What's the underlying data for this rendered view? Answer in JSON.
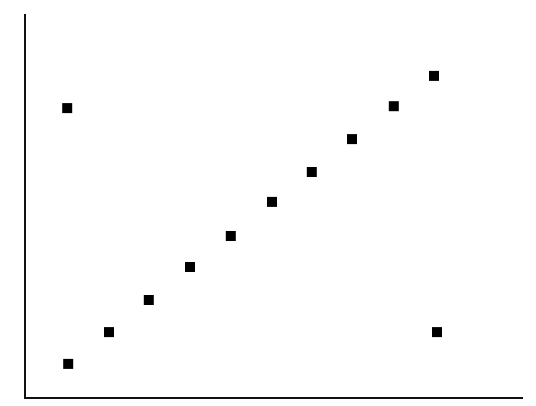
{
  "chart_data": {
    "type": "scatter",
    "title": "",
    "xlabel": "",
    "ylabel": "",
    "xlim": [
      0,
      100
    ],
    "ylim": [
      0,
      100
    ],
    "grid": false,
    "legend": null,
    "ticks": false,
    "marker": "square",
    "marker_color": "#000000",
    "axis_color": "#111111",
    "note": "No tick labels visible; values are estimated on a normalized 0-100 scale relative to the axis box.",
    "series": [
      {
        "name": "points",
        "points": [
          {
            "x": 8.5,
            "y": 75.7
          },
          {
            "x": 8.7,
            "y": 8.9
          },
          {
            "x": 16.9,
            "y": 17.2
          },
          {
            "x": 24.9,
            "y": 25.6
          },
          {
            "x": 33.2,
            "y": 34.2
          },
          {
            "x": 41.4,
            "y": 42.3
          },
          {
            "x": 49.7,
            "y": 51.2
          },
          {
            "x": 57.7,
            "y": 59.0
          },
          {
            "x": 65.8,
            "y": 67.6
          },
          {
            "x": 74.2,
            "y": 76.2
          },
          {
            "x": 82.3,
            "y": 84.1
          },
          {
            "x": 82.9,
            "y": 17.2
          }
        ]
      }
    ]
  },
  "layout": {
    "axis_box": {
      "left": 25,
      "right": 522,
      "top": 15,
      "bottom": 398
    },
    "marker_size": 10,
    "axis_width": 2
  }
}
